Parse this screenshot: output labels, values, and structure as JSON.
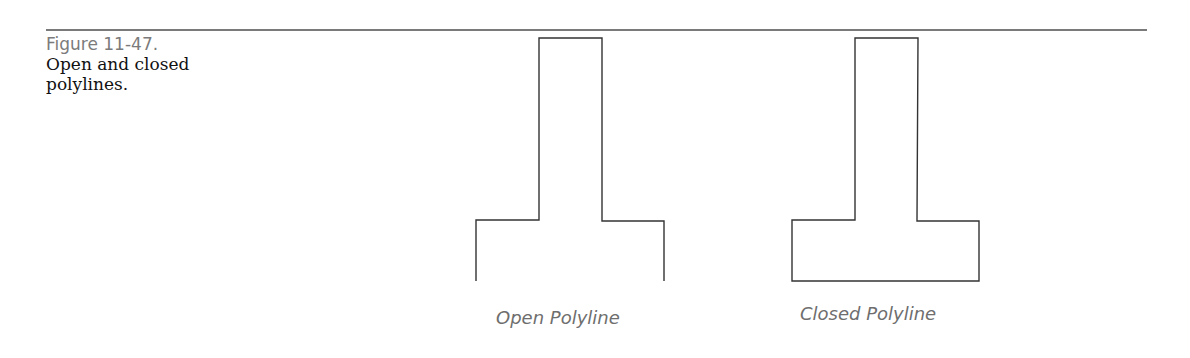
{
  "figure": {
    "number": "Figure 11-47.",
    "caption": "Open and closed polylines."
  },
  "drawings": [
    {
      "label": "Open Polyline",
      "closed": false,
      "points": "476,281 476,220 539,220 539,38 602,38 602,221 664,221 664,281"
    },
    {
      "label": "Closed Polyline",
      "closed": true,
      "points": "792,220 855,220 855,38 918,38 917,221 979,221 979,281 792,281"
    }
  ],
  "colors": {
    "rule": "#7a7a7a",
    "line": "#333333",
    "label": "#6e6e6e",
    "figure_number": "#7b7b7b"
  }
}
